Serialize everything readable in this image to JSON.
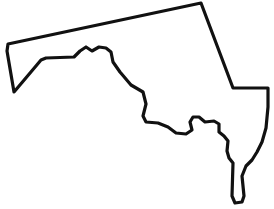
{
  "figure": {
    "kind": "map-outline",
    "title": "Maryland",
    "caption": "",
    "width_px": 274,
    "height_px": 209,
    "background_color": "#ffffff",
    "stroke_color": "#111111",
    "fill_color": "#ffffff",
    "stroke_width_px": 3.2,
    "labels_visible": false
  },
  "map_data": {
    "type": "outline",
    "region_name": "Maryland",
    "projection_note": "unlabeled simplified silhouette",
    "features": [
      {
        "name": "western-panhandle",
        "description": "narrow wedge tapering to a point at the far west"
      },
      {
        "name": "mason-dixon-line",
        "description": "jagged northern boundary with two rounded rises"
      },
      {
        "name": "northeast-diagonal-border",
        "description": "long straight diagonal from the northern apex down to the east"
      },
      {
        "name": "eastern-shore",
        "description": "blocky eastern lobe with a slender southern tail"
      },
      {
        "name": "chesapeake-bay-notch",
        "description": "hook-shaped inlet cut into the lower middle of the shape"
      },
      {
        "name": "potomac-boundary",
        "description": "wavy southern border sweeping west from the bay notch"
      }
    ],
    "outline_path": "M 201 3 L 8 44 L 7 51 L 14 92 L 25 79 L 41 60 L 46 58 L 74 57 L 80 51 L 86 47 L 92 51 L 99 47 L 106 48 L 111 52 L 113 62 L 120 72 L 131 85 L 143 92 L 146 104 L 143 116 L 146 122 L 158 123 L 168 127 L 176 133 L 186 134 L 192 130 L 190 122 L 193 117 L 199 117 L 205 122 L 214 121 L 219 124 L 219 132 L 224 136 L 228 141 L 227 151 L 229 158 L 233 163 L 232 196 L 235 203 L 242 202 L 244 196 L 242 176 L 246 166 L 252 160 L 257 152 L 262 142 L 266 128 L 268 107 L 268 88 L 250 88 L 233 88 Z"
  },
  "annotations": []
}
